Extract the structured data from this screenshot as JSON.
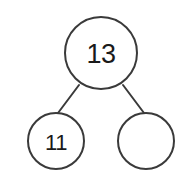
{
  "diagram": {
    "type": "number-bond",
    "background_color": "#ffffff",
    "stroke_color": "#3a3a3a",
    "text_color": "#1a1a1a",
    "whole": {
      "label": "13",
      "value": 13,
      "filled": true,
      "cx": 101,
      "cy": 53,
      "r": 36
    },
    "parts": [
      {
        "label": "11",
        "value": 11,
        "filled": true,
        "cx": 56,
        "cy": 141,
        "r": 28
      },
      {
        "label": "",
        "value": null,
        "filled": false,
        "cx": 146,
        "cy": 141,
        "r": 28
      }
    ],
    "connectors": [
      {
        "name": "whole-to-left-part",
        "x1": 79,
        "y1": 85,
        "x2": 58,
        "y2": 113
      },
      {
        "name": "whole-to-right-part",
        "x1": 123,
        "y1": 85,
        "x2": 144,
        "y2": 113
      }
    ]
  }
}
